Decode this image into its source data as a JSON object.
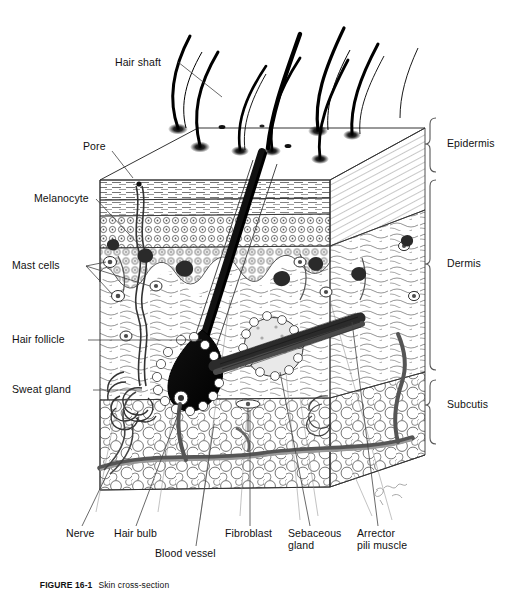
{
  "figure": {
    "number_label": "FIGURE 16-1",
    "caption_text": "Skin cross-section",
    "title": "Skin cross-section"
  },
  "labels": {
    "left": [
      {
        "id": "hair-shaft",
        "text": "Hair shaft",
        "x": 115,
        "y": 63
      },
      {
        "id": "pore",
        "text": "Pore",
        "x": 83,
        "y": 147
      },
      {
        "id": "melanocyte",
        "text": "Melanocyte",
        "x": 34,
        "y": 195
      },
      {
        "id": "mast-cells",
        "text": "Mast cells",
        "x": 12,
        "y": 262
      },
      {
        "id": "hair-follicle",
        "text": "Hair follicle",
        "x": 12,
        "y": 335
      },
      {
        "id": "sweat-gland",
        "text": "Sweat gland",
        "x": 12,
        "y": 385
      }
    ],
    "right": [
      {
        "id": "epidermis",
        "text": "Epidermis",
        "x": 447,
        "y": 143,
        "bracket_top": 118,
        "bracket_bottom": 172
      },
      {
        "id": "dermis",
        "text": "Dermis",
        "x": 447,
        "y": 263,
        "bracket_top": 180,
        "bracket_bottom": 370
      },
      {
        "id": "subcutis",
        "text": "Subcutis",
        "x": 447,
        "y": 404,
        "bracket_top": 380,
        "bracket_bottom": 444
      }
    ],
    "bottom": [
      {
        "id": "nerve",
        "text": "Nerve",
        "x": 66,
        "y": 533
      },
      {
        "id": "hair-bulb",
        "text": "Hair bulb",
        "x": 114,
        "y": 533
      },
      {
        "id": "blood-vessel",
        "text": "Blood vessel",
        "x": 155,
        "y": 553
      },
      {
        "id": "fibroblast",
        "text": "Fibroblast",
        "x": 225,
        "y": 533
      },
      {
        "id": "sebaceous-gland",
        "text": "Sebaceous\ngland",
        "x": 288,
        "y": 533
      },
      {
        "id": "arrector-pili",
        "text": "Arrector\npili muscle",
        "x": 357,
        "y": 533
      }
    ]
  },
  "structures": {
    "hair_count": 10,
    "layers": [
      "Epidermis",
      "Dermis",
      "Subcutis"
    ],
    "cell_types": [
      "Melanocyte",
      "Mast cells",
      "Fibroblast"
    ],
    "appendages": [
      "Hair follicle",
      "Sweat gland",
      "Sebaceous gland",
      "Arrector pili muscle"
    ],
    "vasculature": [
      "Blood vessel",
      "Nerve"
    ]
  },
  "colors": {
    "ink": "#1a1a1a",
    "line": "#333333",
    "background": "#ffffff",
    "bracket": "#555555",
    "leader": "#444444"
  }
}
